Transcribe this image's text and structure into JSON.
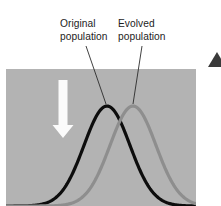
{
  "figure": {
    "background_color": "#ffffff",
    "width": 221,
    "height": 206
  },
  "panel": {
    "name": "shaded-plot-panel",
    "fill_color": "#b3b3b3",
    "x": 6,
    "y": 69,
    "width": 190,
    "height": 137
  },
  "labels": {
    "original": {
      "line1": "Original",
      "line2": "population",
      "color": "#1d1d1d",
      "x": 60,
      "y1": 27,
      "y2": 40
    },
    "evolved": {
      "line1": "Evolved",
      "line2": "population",
      "color": "#1d1d1d",
      "x": 118,
      "y1": 27,
      "y2": 40
    }
  },
  "leaders": {
    "original_leader": {
      "x1": 86,
      "y1": 46,
      "x2": 106,
      "y2": 104,
      "color": "#2b2b2b"
    },
    "evolved_leader": {
      "x1": 142,
      "y1": 46,
      "x2": 133,
      "y2": 104,
      "color": "#2b2b2b"
    }
  },
  "curves": {
    "original": {
      "name": "Original population",
      "color": "#0d0d0d",
      "peak_x": 107,
      "peak_y": 106,
      "baseline_y": 206,
      "stroke_width": 3.2
    },
    "evolved": {
      "name": "Evolved population",
      "color": "#8e8e8e",
      "peak_x": 133,
      "peak_y": 106,
      "baseline_y": 206,
      "stroke_width": 3.2
    }
  },
  "arrow": {
    "name": "downward-selection-arrow",
    "direction": "down",
    "color": "#fbfbfb",
    "x_center": 63,
    "y_top": 80,
    "y_tip": 138,
    "shaft_width": 9,
    "head_width": 21
  },
  "corner_mark": {
    "name": "page-corner-arrowhead",
    "color": "#3a3a3a",
    "x": 208,
    "y": 52
  },
  "chart_data": {
    "type": "line",
    "xlabel": "",
    "ylabel": "",
    "grid": false,
    "legend_position": "inline-callouts",
    "xlim": [
      0,
      221
    ],
    "ylim": [
      0,
      206
    ],
    "series": [
      {
        "name": "Original population",
        "color": "#0d0d0d",
        "distribution": "normal",
        "mean_x": 107,
        "peak_y": 106,
        "spread_x": 46
      },
      {
        "name": "Evolved population",
        "color": "#8e8e8e",
        "distribution": "normal",
        "mean_x": 133,
        "peak_y": 106,
        "spread_x": 46
      }
    ],
    "annotations": [
      "Original population",
      "Evolved population"
    ]
  }
}
